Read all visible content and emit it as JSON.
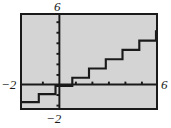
{
  "figure": {
    "name": "step-function-graph",
    "background_color": "#ffffff",
    "plot_background_color": "#d4d4d4",
    "frame_color": "#1a1a1a",
    "curve_color": "#1a1a1a"
  },
  "labels": {
    "y_max": "6",
    "x_min": "−2",
    "y_min": "−2",
    "x_max": "6"
  },
  "chart_data": {
    "type": "line",
    "title": "",
    "xlabel": "",
    "ylabel": "",
    "xlim": [
      -2,
      6
    ],
    "ylim": [
      -2,
      6
    ],
    "xticks": [
      -2,
      -1,
      0,
      1,
      2,
      3,
      4,
      5,
      6
    ],
    "yticks": [
      -2,
      -1,
      0,
      1,
      2,
      3,
      4,
      5,
      6
    ],
    "tick_labels_shown": [
      "-2",
      "6"
    ],
    "grid": false,
    "axes_shown": [
      "x-axis",
      "y-axis"
    ],
    "legend": null,
    "series": [
      {
        "name": "step-function",
        "style": "staircase",
        "steps": [
          {
            "x_start": -2.0,
            "x_end": -1.0,
            "y": -1.5
          },
          {
            "x_start": -1.0,
            "x_end": 0.0,
            "y": -0.8
          },
          {
            "x_start": 0.0,
            "x_end": 1.0,
            "y": -0.1
          },
          {
            "x_start": 1.0,
            "x_end": 2.0,
            "y": 0.6
          },
          {
            "x_start": 2.0,
            "x_end": 3.0,
            "y": 1.4
          },
          {
            "x_start": 3.0,
            "x_end": 4.0,
            "y": 2.2
          },
          {
            "x_start": 4.0,
            "x_end": 5.0,
            "y": 3.0
          },
          {
            "x_start": 5.0,
            "x_end": 6.0,
            "y": 3.8
          },
          {
            "x_start": 6.0,
            "x_end": 6.6,
            "y": 4.6
          }
        ]
      }
    ]
  }
}
